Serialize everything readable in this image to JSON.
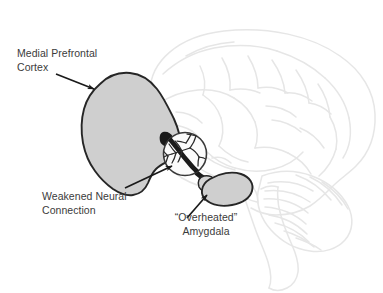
{
  "figure": {
    "background_color": "#ffffff",
    "width": 383,
    "height": 293
  },
  "colors": {
    "brain_outline": "#e6e6e6",
    "region_fill": "#cfcfcf",
    "region_stroke": "#262626",
    "connection_stroke": "#1a1a1a",
    "arrow": "#1a1a1a",
    "text": "#3b3b3b",
    "inset_stroke": "#3a3a3a"
  },
  "labels": {
    "mpfc": {
      "line1": "Medial Prefrontal",
      "line2": "Cortex"
    },
    "weakened_connection": {
      "line1": "Weakened Neural",
      "line2": "Connection"
    },
    "amygdala": {
      "line1": "“Overheated”",
      "line2": "Amygdala"
    }
  },
  "anatomy": {
    "brain_silhouette": "sagittal-brain-outline",
    "cerebellum": "cerebellum-folia",
    "brainstem": "brainstem",
    "mpfc_region": "shaded-medial-prefrontal-cortex",
    "amygdala_region": "shaded-amygdala",
    "connection": "thick-dark-neural-tract",
    "magnifier_inset": "branching-neuron-closeup"
  },
  "arrows": [
    {
      "name": "arrow-to-mpfc",
      "points_to": "mpfc"
    },
    {
      "name": "arrow-to-connection",
      "points_to": "weakened_connection"
    },
    {
      "name": "arrow-to-amygdala",
      "points_to": "amygdala"
    }
  ]
}
